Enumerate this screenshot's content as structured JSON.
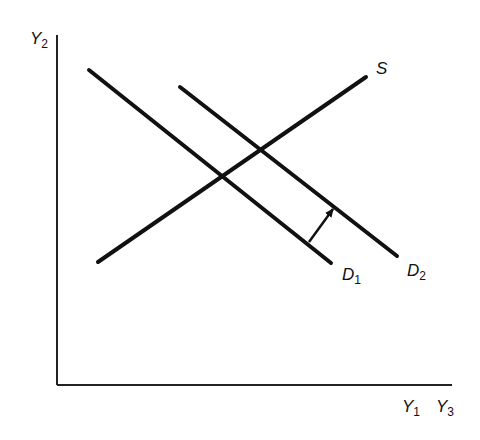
{
  "diagram": {
    "type": "supply-demand shift",
    "axes": {
      "y_label": {
        "base": "Y",
        "sub": "2"
      },
      "x_labels": [
        {
          "base": "Y",
          "sub": "1"
        },
        {
          "base": "Y",
          "sub": "3"
        }
      ]
    },
    "curves": [
      {
        "id": "S",
        "label": {
          "base": "S",
          "sub": ""
        },
        "from": [
          98,
          262
        ],
        "to": [
          366,
          77
        ]
      },
      {
        "id": "D1",
        "label": {
          "base": "D",
          "sub": "1"
        },
        "from": [
          89,
          70
        ],
        "to": [
          331,
          263
        ]
      },
      {
        "id": "D2",
        "label": {
          "base": "D",
          "sub": "2"
        },
        "from": [
          180,
          87
        ],
        "to": [
          397,
          256
        ]
      }
    ],
    "shift_arrow": {
      "from": [
        309,
        242
      ],
      "to": [
        333,
        209
      ],
      "meaning": "demand shifts from D1 to D2"
    },
    "colors": {
      "line": "#111111",
      "background": "#ffffff"
    }
  }
}
